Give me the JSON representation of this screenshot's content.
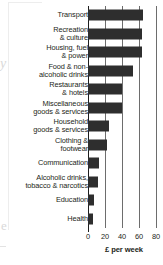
{
  "chart_data": {
    "type": "bar",
    "orientation": "horizontal",
    "title": "",
    "xlabel": "£ per week",
    "ylabel": "",
    "xlim": [
      0,
      80
    ],
    "xticks": [
      "0",
      "20",
      "40",
      "60",
      "80"
    ],
    "grid": true,
    "legend": null,
    "bar_color": "#2e2e2e",
    "categories": [
      "Transport",
      "Recreation\n& culture",
      "Housing, fuel\n& power",
      "Food & non-\nalcoholic drinks",
      "Restaurants\n& hotels",
      "Miscellaneous\ngoods & services",
      "Household\ngoods & services",
      "Clothing &\nfootwear",
      "Communication",
      "Alcoholic drinks,\ntobacco & narcotics",
      "Education",
      "Health"
    ],
    "values": [
      65,
      64,
      64,
      53,
      40,
      40,
      25,
      22,
      13,
      12,
      7,
      6
    ]
  },
  "bleed": {
    "glyph_1": "y",
    "glyph_2": "e"
  }
}
